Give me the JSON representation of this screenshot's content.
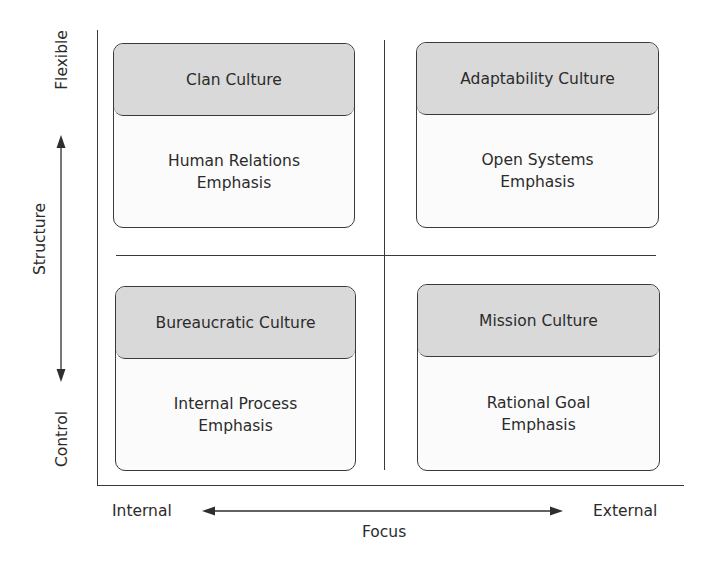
{
  "diagram": {
    "type": "quadrant-matrix",
    "y_axis": {
      "label": "Structure",
      "top": "Flexible",
      "bottom": "Control"
    },
    "x_axis": {
      "label": "Focus",
      "left": "Internal",
      "right": "External"
    },
    "quadrants": [
      {
        "position": "top-left",
        "title": "Clan Culture",
        "body_line1": "Human Relations",
        "body_line2": "Emphasis"
      },
      {
        "position": "top-right",
        "title": "Adaptability Culture",
        "body_line1": "Open Systems",
        "body_line2": "Emphasis"
      },
      {
        "position": "bottom-left",
        "title": "Bureaucratic Culture",
        "body_line1": "Internal Process",
        "body_line2": "Emphasis"
      },
      {
        "position": "bottom-right",
        "title": "Mission Culture",
        "body_line1": "Rational Goal",
        "body_line2": "Emphasis"
      }
    ],
    "colors": {
      "header_fill": "#d9d9d9",
      "body_fill": "#fbfbfb",
      "line": "#3a3a3a",
      "text": "#2b2b2b"
    }
  }
}
